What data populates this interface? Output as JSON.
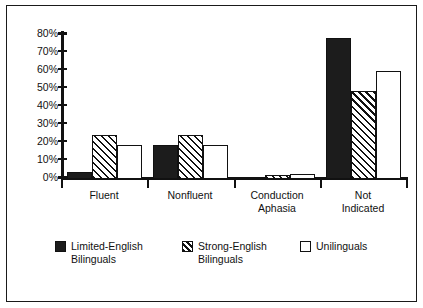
{
  "chart_data": {
    "type": "bar",
    "title": "",
    "subtitle": "",
    "xlabel": "",
    "ylabel": "",
    "ylim": [
      0,
      80
    ],
    "grid": false,
    "legend_position": "bottom",
    "y_ticks": [
      "0%",
      "10%",
      "20%",
      "30%",
      "40%",
      "50%",
      "60%",
      "70%",
      "80%"
    ],
    "y_tick_values": [
      0,
      10,
      20,
      30,
      40,
      50,
      60,
      70,
      80
    ],
    "categories": [
      "Fluent",
      "Nonfluent",
      "Conduction\nAphasia",
      "Not\nIndicated"
    ],
    "series": [
      {
        "name": "Limited-English\nBilinguals",
        "style": "solid-dark",
        "color": "#1c1c1c",
        "values": [
          4,
          18.5,
          0,
          77.5
        ]
      },
      {
        "name": "Strong-English\nBilinguals",
        "style": "diagonal-hatch",
        "color": "#111111",
        "values": [
          24,
          24,
          2,
          48
        ]
      },
      {
        "name": "Unilinguals",
        "style": "open-white",
        "color": "#ffffff",
        "values": [
          18.5,
          18.5,
          3,
          59
        ]
      }
    ]
  },
  "axis": {
    "tick_labels": [
      "80%",
      "70%",
      "60%",
      "50%",
      "40%",
      "30%",
      "20%",
      "10%",
      "0%"
    ]
  },
  "legend": {
    "items": [
      {
        "label": "Limited-English\nBilinguals",
        "swatch": "solid-dark"
      },
      {
        "label": "Strong-English\nBilinguals",
        "swatch": "diagonal-hatch"
      },
      {
        "label": "Unilinguals",
        "swatch": "open-white"
      }
    ]
  }
}
